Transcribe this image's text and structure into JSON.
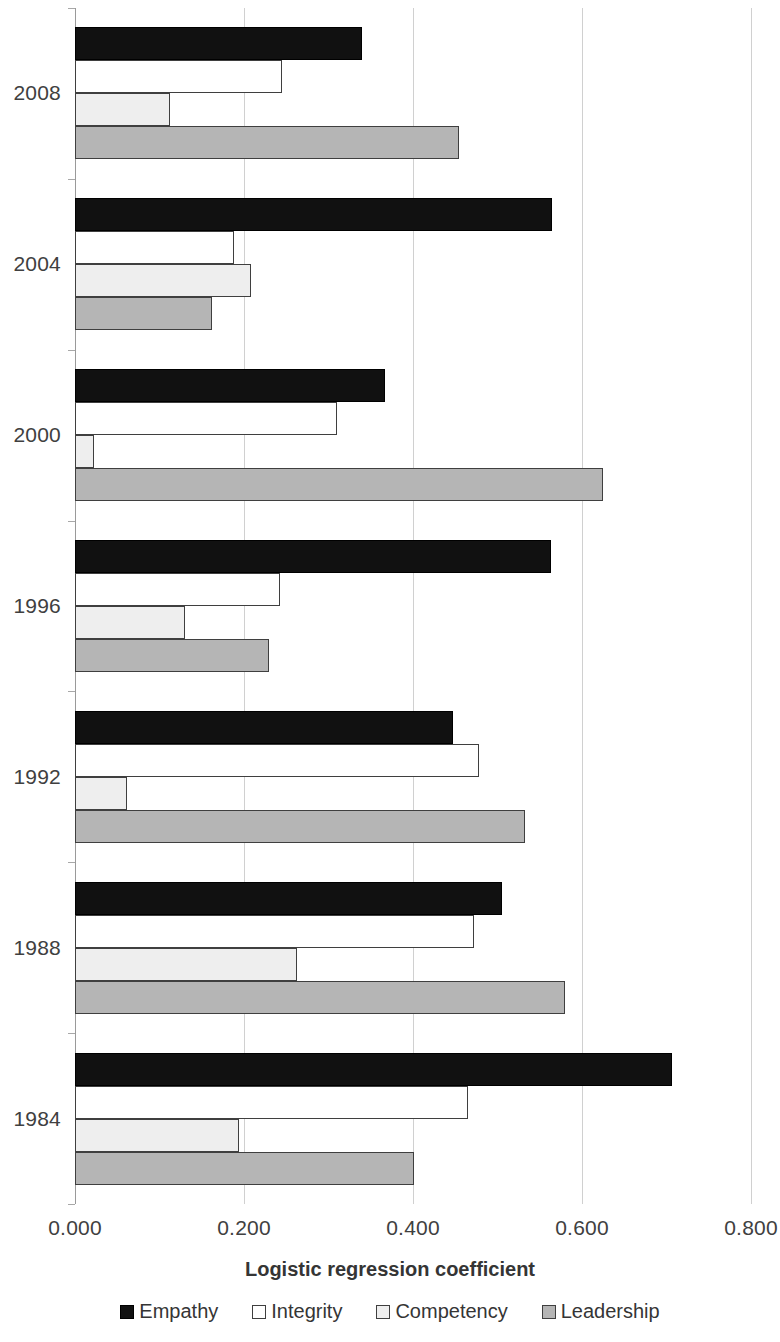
{
  "chart_data": {
    "type": "bar",
    "orientation": "horizontal",
    "title": "",
    "xlabel": "Logistic regression coefficient",
    "ylabel": "",
    "xlim": [
      0.0,
      0.8
    ],
    "xticks": [
      "0.000",
      "0.200",
      "0.400",
      "0.600",
      "0.800"
    ],
    "xtick_values": [
      0.0,
      0.2,
      0.4,
      0.6,
      0.8
    ],
    "grid": true,
    "legend_position": "bottom",
    "categories": [
      "2008",
      "2004",
      "2000",
      "1996",
      "1992",
      "1988",
      "1984"
    ],
    "series": [
      {
        "name": "Empathy",
        "color": "#111111",
        "values": [
          0.34,
          0.564,
          0.367,
          0.563,
          0.447,
          0.505,
          0.707
        ]
      },
      {
        "name": "Integrity",
        "color": "#ffffff",
        "values": [
          0.245,
          0.188,
          0.31,
          0.243,
          0.478,
          0.472,
          0.465
        ]
      },
      {
        "name": "Competency",
        "color": "#eeeeee",
        "values": [
          0.113,
          0.208,
          0.023,
          0.13,
          0.062,
          0.263,
          0.194
        ]
      },
      {
        "name": "Leadership",
        "color": "#b5b5b5",
        "values": [
          0.455,
          0.162,
          0.625,
          0.229,
          0.533,
          0.58,
          0.401
        ]
      }
    ]
  },
  "legend": {
    "items": [
      {
        "label": "Empathy",
        "swatch": "empathy-swatch-icon"
      },
      {
        "label": "Integrity",
        "swatch": "integrity-swatch-icon"
      },
      {
        "label": "Competency",
        "swatch": "competency-swatch-icon"
      },
      {
        "label": "Leadership",
        "swatch": "leadership-swatch-icon"
      }
    ]
  }
}
